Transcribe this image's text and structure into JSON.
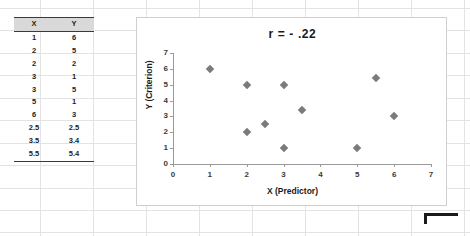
{
  "table": {
    "headers": [
      "X",
      "Y"
    ],
    "rows": [
      [
        "1",
        "6"
      ],
      [
        "2",
        "5"
      ],
      [
        "2",
        "2"
      ],
      [
        "3",
        "1"
      ],
      [
        "3",
        "5"
      ],
      [
        "5",
        "1"
      ],
      [
        "6",
        "3"
      ],
      [
        "2.5",
        "2.5"
      ],
      [
        "3.5",
        "3.4"
      ],
      [
        "5.5",
        "5.4"
      ]
    ]
  },
  "chart_data": {
    "type": "scatter",
    "title": "r = -  .22",
    "xlabel": "X (Predictor)",
    "ylabel": "Y (Criterion)",
    "xlim": [
      0,
      7
    ],
    "ylim": [
      0,
      7
    ],
    "xticks": [
      "0",
      "1",
      "2",
      "3",
      "4",
      "5",
      "6",
      "7"
    ],
    "yticks": [
      "0",
      "1",
      "2",
      "3",
      "4",
      "5",
      "6",
      "7"
    ],
    "grid": false,
    "legend": false,
    "marker": "diamond",
    "marker_color": "#7b7b7b",
    "series": [
      {
        "name": "XY",
        "points": [
          {
            "x": 1,
            "y": 6
          },
          {
            "x": 2,
            "y": 5
          },
          {
            "x": 2,
            "y": 2
          },
          {
            "x": 3,
            "y": 1
          },
          {
            "x": 3,
            "y": 5
          },
          {
            "x": 5,
            "y": 1
          },
          {
            "x": 6,
            "y": 3
          },
          {
            "x": 2.5,
            "y": 2.5
          },
          {
            "x": 3.5,
            "y": 3.4
          },
          {
            "x": 5.5,
            "y": 5.4
          }
        ]
      }
    ]
  },
  "sheet": {
    "column_line_x": [
      40,
      93,
      146,
      199,
      252,
      305,
      358,
      411,
      464
    ],
    "row_line_y": [
      8,
      30,
      53,
      75,
      98,
      120,
      143,
      165,
      188,
      210,
      232
    ]
  }
}
